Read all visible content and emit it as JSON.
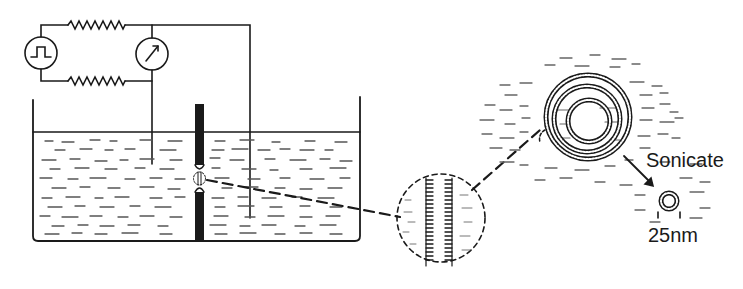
{
  "figure": {
    "circuit": {
      "components": [
        "pulse-generator",
        "resistor-top",
        "resistor-bottom",
        "meter"
      ]
    },
    "bilayer_inset": {
      "label": ""
    },
    "liposome": {
      "layers": 3
    },
    "labels": {
      "sonicate": "Sonicate",
      "size": "25nm"
    },
    "colors": {
      "ink": "#1a1a1a",
      "background": "#ffffff"
    }
  }
}
